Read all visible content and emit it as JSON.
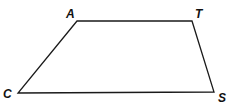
{
  "diagram": {
    "type": "quadrilateral (trapezoid)",
    "vertices": [
      {
        "label": "A",
        "x": 77,
        "y": 21,
        "lx": 66,
        "ly": 18
      },
      {
        "label": "T",
        "x": 192,
        "y": 21,
        "lx": 195,
        "ly": 18
      },
      {
        "label": "S",
        "x": 214,
        "y": 92,
        "lx": 218,
        "ly": 102
      },
      {
        "label": "C",
        "x": 18,
        "y": 93,
        "lx": 3,
        "ly": 98
      }
    ],
    "stroke_color": "#1a1a1a"
  }
}
